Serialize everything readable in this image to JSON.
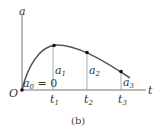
{
  "figure": {
    "y_axis_label": "a",
    "x_axis_label": "t",
    "origin_label": "O",
    "caption": "(b)",
    "initial_value": {
      "symbol": "a",
      "subscript": "0",
      "text": " = 0"
    },
    "points": [
      {
        "t": "t",
        "t_sub": "1",
        "a": "a",
        "a_sub": "1"
      },
      {
        "t": "t",
        "t_sub": "2",
        "a": "a",
        "a_sub": "2"
      },
      {
        "t": "t",
        "t_sub": "3",
        "a": "a",
        "a_sub": "3"
      }
    ]
  }
}
